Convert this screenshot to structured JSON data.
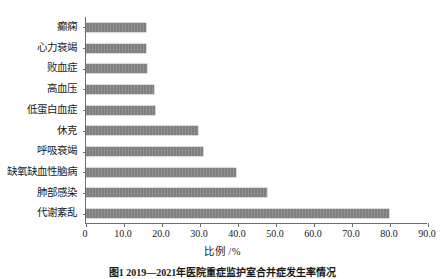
{
  "chart_data": {
    "type": "bar",
    "orientation": "horizontal",
    "title": "",
    "xlabel": "比例 /%",
    "ylabel": "",
    "xlim": [
      0,
      90
    ],
    "ylim": null,
    "grid": false,
    "legend": null,
    "bar_color": "#7f7f7f",
    "xticks": [
      "0",
      "10.0",
      "20.0",
      "30.0",
      "40.0",
      "50.0",
      "60.0",
      "70.0",
      "80.0",
      "90.0"
    ],
    "xtick_values": [
      0,
      10,
      20,
      30,
      40,
      50,
      60,
      70,
      80,
      90
    ],
    "categories": [
      "癫痫",
      "心力衰竭",
      "败血症",
      "高血压",
      "低蛋白血症",
      "休克",
      "呼吸衰竭",
      "缺氧缺血性脑病",
      "肺部感染",
      "代谢紊乱"
    ],
    "values": [
      15.8,
      15.8,
      16.1,
      17.8,
      18.2,
      29.5,
      30.8,
      39.5,
      47.6,
      79.7
    ]
  },
  "caption": {
    "text": "图1 2019—2021年医院重症监护室合并症发生率情况"
  }
}
